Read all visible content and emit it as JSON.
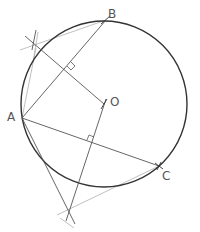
{
  "diagram": {
    "colors": {
      "circle": "#333333",
      "line": "#444444",
      "construction": "#aaaaaa",
      "label": "#555555"
    },
    "circle": {
      "cx": 104,
      "cy": 104,
      "r": 83
    },
    "points": {
      "A": {
        "label": "A",
        "x": 22,
        "y": 118,
        "lx": 7,
        "ly": 120
      },
      "B": {
        "label": "B",
        "x": 106,
        "y": 20,
        "lx": 108,
        "ly": 17
      },
      "C": {
        "label": "C",
        "x": 159,
        "y": 166,
        "lx": 162,
        "ly": 177
      },
      "O": {
        "label": "O",
        "x": 104,
        "y": 104,
        "lx": 110,
        "ly": 104
      }
    },
    "construction_points": {
      "P": {
        "x": 36,
        "y": 48
      },
      "Q": {
        "x": 68,
        "y": 211
      }
    },
    "labels": {
      "A": "A",
      "B": "B",
      "C": "C",
      "O": "O"
    }
  }
}
